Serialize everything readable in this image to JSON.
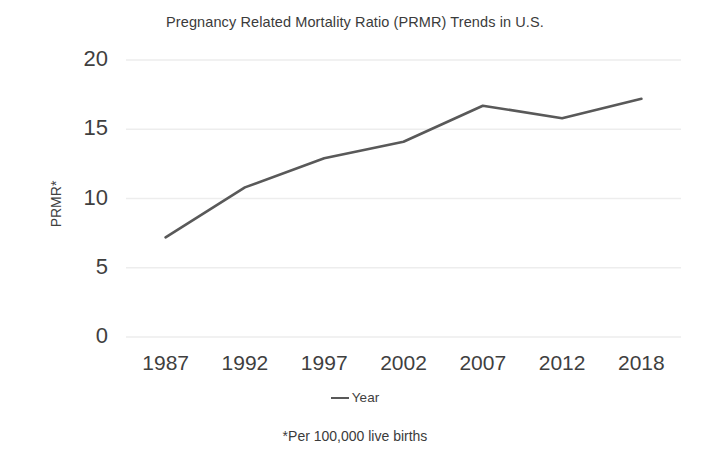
{
  "chart_data": {
    "type": "line",
    "title": "Pregnancy Related Mortality Ratio (PRMR) Trends in U.S.",
    "xlabel": "",
    "ylabel": "PRMR*",
    "categories": [
      "1987",
      "1992",
      "1997",
      "2002",
      "2007",
      "2012",
      "2018"
    ],
    "values": [
      7.2,
      10.8,
      12.9,
      14.1,
      16.7,
      15.8,
      17.2
    ],
    "series": [
      {
        "name": "Year",
        "values": [
          7.2,
          10.8,
          12.9,
          14.1,
          16.7,
          15.8,
          17.2
        ]
      }
    ],
    "ylim": [
      0,
      20
    ],
    "yticks": [
      "0",
      "5",
      "10",
      "15",
      "20"
    ],
    "ytick_values": [
      0,
      5,
      10,
      15,
      20
    ],
    "grid": "horizontal",
    "legend_position": "bottom",
    "legend_entries": [
      "Year"
    ],
    "footnote": "*Per 100,000 live births",
    "line_color": "#595959",
    "gridline_color": "#ededed",
    "background_color": "#ffffff"
  }
}
